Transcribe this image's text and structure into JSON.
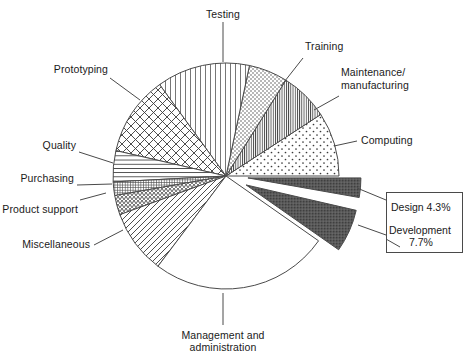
{
  "figure": {
    "background": "#ffffff",
    "ink": "#1a1a1a",
    "dark_slice_color": "#595959",
    "line_color": "#4a4a4a"
  },
  "chart_data": {
    "type": "pie",
    "title": "",
    "subtitle": "",
    "xlabel": "",
    "ylabel": "",
    "legend_position": "callout-right",
    "grid": false,
    "center": {
      "x": 226,
      "y": 176
    },
    "radius": 113,
    "note": "Angles measured counter-clockwise from 3 o'clock (0 deg). Percent values shown only for the two exploded dark slices.",
    "categories": [
      "Computing",
      "Maintenance/ manufacturing",
      "Training",
      "Testing",
      "Prototyping",
      "Quality",
      "Purchasing",
      "Product support",
      "Miscellaneous",
      "Management and administration",
      "Development",
      "Design"
    ],
    "values": [
      12.0,
      9.0,
      7.0,
      16.5,
      13.5,
      5.5,
      2.0,
      3.0,
      9.5,
      30.0,
      7.7,
      4.3
    ],
    "slices": [
      {
        "key": "computing",
        "label": "Computing",
        "pattern": "sparse-dots",
        "start_deg": 0,
        "end_deg": 33,
        "value": 12.0,
        "exploded": false,
        "pct_text": ""
      },
      {
        "key": "maintenance",
        "label": "Maintenance/ manufacturing",
        "pattern": "dense-vertical",
        "start_deg": 33,
        "end_deg": 58,
        "value": 9.0,
        "exploded": false,
        "pct_text": ""
      },
      {
        "key": "training",
        "label": "Training",
        "pattern": "dot-grid",
        "start_deg": 58,
        "end_deg": 78,
        "value": 7.0,
        "exploded": false,
        "pct_text": ""
      },
      {
        "key": "testing",
        "label": "Testing",
        "pattern": "vertical-lines",
        "start_deg": 78,
        "end_deg": 126,
        "value": 16.5,
        "exploded": false,
        "pct_text": ""
      },
      {
        "key": "prototyping",
        "label": "Prototyping",
        "pattern": "cross-hatch",
        "start_deg": 126,
        "end_deg": 167,
        "value": 13.5,
        "exploded": false,
        "pct_text": ""
      },
      {
        "key": "quality",
        "label": "Quality",
        "pattern": "horizontal-lines",
        "start_deg": 167,
        "end_deg": 183,
        "value": 5.5,
        "exploded": false,
        "pct_text": ""
      },
      {
        "key": "purchasing",
        "label": "Purchasing",
        "pattern": "fine-grid",
        "start_deg": 183,
        "end_deg": 190,
        "value": 2.0,
        "exploded": false,
        "pct_text": ""
      },
      {
        "key": "product-support",
        "label": "Product support",
        "pattern": "zigzag-dense",
        "start_deg": 190,
        "end_deg": 200,
        "value": 3.0,
        "exploded": false,
        "pct_text": ""
      },
      {
        "key": "miscellaneous",
        "label": "Miscellaneous",
        "pattern": "diagonal-lines",
        "start_deg": 200,
        "end_deg": 233,
        "value": 9.5,
        "exploded": false,
        "pct_text": ""
      },
      {
        "key": "management",
        "label": "Management and administration",
        "pattern": "none",
        "start_deg": 233,
        "end_deg": 325,
        "value": 30.0,
        "exploded": false,
        "pct_text": ""
      },
      {
        "key": "development",
        "label": "Development",
        "pattern": "solid-dark",
        "start_deg": 325,
        "end_deg": 347,
        "value": 7.7,
        "exploded": true,
        "pct_text": "7.7%"
      },
      {
        "key": "design",
        "label": "Design",
        "pattern": "solid-dark",
        "start_deg": 350,
        "end_deg": 360,
        "value": 4.3,
        "exploded": true,
        "pct_text": "4.3%"
      }
    ]
  },
  "labels": {
    "testing": "Testing",
    "training": "Training",
    "maintenance_line1": "Maintenance/",
    "maintenance_line2": "manufacturing",
    "computing": "Computing",
    "prototyping": "Prototyping",
    "quality": "Quality",
    "purchasing": "Purchasing",
    "product_support": "Product support",
    "miscellaneous": "Miscellaneous",
    "management_line1": "Management and",
    "management_line2": "administration"
  },
  "callout": {
    "design": "Design 4.3%",
    "development_line1": "Development",
    "development_line2": "7.7%"
  }
}
